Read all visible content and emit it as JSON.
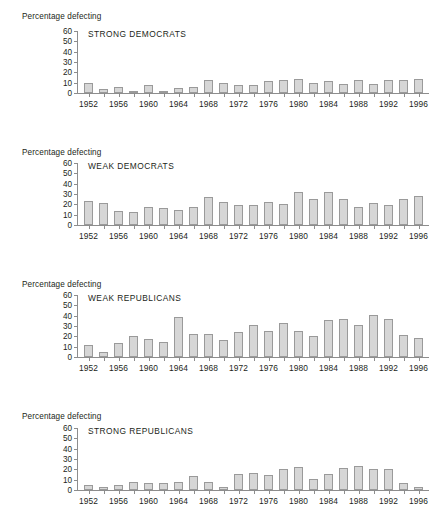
{
  "figure": {
    "axis_caption": "Percentage defecting",
    "y_ticks": [
      0,
      10,
      20,
      30,
      40,
      50,
      60
    ],
    "x_tick_years": [
      1952,
      1956,
      1960,
      1964,
      1968,
      1972,
      1976,
      1980,
      1984,
      1988,
      1992,
      1996
    ],
    "bar_fill": "#d6d6d6",
    "bar_stroke": "#9a9a9a",
    "axis_color": "#8d8d8d",
    "text_color": "#231f20"
  },
  "chart_data": [
    {
      "type": "bar",
      "title": "STRONG DEMOCRATS",
      "xlabel": "",
      "ylabel": "Percentage defecting",
      "ylim": [
        0,
        60
      ],
      "grid": false,
      "legend": "none",
      "categories": [
        1952,
        1954,
        1956,
        1958,
        1960,
        1962,
        1964,
        1966,
        1968,
        1970,
        1972,
        1974,
        1976,
        1978,
        1980,
        1982,
        1984,
        1986,
        1988,
        1990,
        1992,
        1994,
        1996
      ],
      "values": [
        10,
        4,
        5.5,
        2,
        8,
        0.8,
        4.5,
        5.5,
        12.5,
        10,
        8,
        8,
        11.5,
        12.5,
        13.5,
        9.5,
        11.5,
        9,
        12.5,
        9,
        12.5,
        12.5,
        13.5
      ]
    },
    {
      "type": "bar",
      "title": "WEAK DEMOCRATS",
      "xlabel": "",
      "ylabel": "Percentage defecting",
      "ylim": [
        0,
        60
      ],
      "grid": false,
      "legend": "none",
      "categories": [
        1952,
        1954,
        1956,
        1958,
        1960,
        1962,
        1964,
        1966,
        1968,
        1970,
        1972,
        1974,
        1976,
        1978,
        1980,
        1982,
        1984,
        1986,
        1988,
        1990,
        1992,
        1994,
        1996
      ],
      "values": [
        23.5,
        21,
        13.5,
        12.5,
        17.5,
        16.5,
        14.5,
        17.5,
        27,
        22,
        19,
        19,
        22,
        20,
        31.5,
        25.5,
        31.5,
        25.5,
        17.5,
        21,
        19,
        25.5,
        28
      ]
    },
    {
      "type": "bar",
      "title": "WEAK REPUBLICANS",
      "xlabel": "",
      "ylabel": "Percentage defecting",
      "ylim": [
        0,
        60
      ],
      "grid": false,
      "legend": "none",
      "categories": [
        1952,
        1954,
        1956,
        1958,
        1960,
        1962,
        1964,
        1966,
        1968,
        1970,
        1972,
        1974,
        1976,
        1978,
        1980,
        1982,
        1984,
        1986,
        1988,
        1990,
        1992,
        1994,
        1996
      ],
      "values": [
        11.5,
        4.5,
        13.5,
        20,
        17,
        15,
        39,
        22,
        22,
        16,
        24.5,
        31,
        25.5,
        32.5,
        25.5,
        20,
        35.5,
        37,
        31,
        41,
        37,
        21,
        18
      ]
    },
    {
      "type": "bar",
      "title": "STRONG REPUBLICANS",
      "xlabel": "",
      "ylabel": "Percentage defecting",
      "ylim": [
        0,
        60
      ],
      "grid": false,
      "legend": "none",
      "categories": [
        1952,
        1954,
        1956,
        1958,
        1960,
        1962,
        1964,
        1966,
        1968,
        1970,
        1972,
        1974,
        1976,
        1978,
        1980,
        1982,
        1984,
        1986,
        1988,
        1990,
        1992,
        1994,
        1996
      ],
      "values": [
        4.5,
        3,
        4.5,
        8,
        7,
        7,
        8,
        13.5,
        8,
        3,
        15.5,
        16.5,
        14.5,
        20,
        22,
        11,
        15.5,
        21,
        23.5,
        20,
        20,
        6.5,
        3
      ]
    }
  ]
}
